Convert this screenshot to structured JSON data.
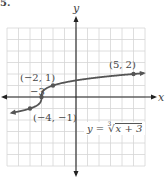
{
  "problem_number": "5.",
  "axes": {
    "x_label": "x",
    "y_label": "y"
  },
  "equation": {
    "lhs": "y =",
    "radical_index": "3",
    "radical_symbol": "√",
    "radicand": "x + 3",
    "full_text": "y = ∛(x + 3)"
  },
  "points": [
    {
      "label": "(5, 2)",
      "x": 5,
      "y": 2
    },
    {
      "label": "(−2, 1)",
      "x": -2,
      "y": 1
    },
    {
      "label": "−3",
      "x": -3,
      "y": 0
    },
    {
      "label": "(−4, −1)",
      "x": -4,
      "y": -1
    }
  ],
  "grid": {
    "xmin": -6,
    "xmax": 6,
    "ymin": -6,
    "ymax": 6,
    "step": 1
  },
  "colors": {
    "curve": "#555555",
    "grid": "#d6d6d6",
    "axis": "#222222",
    "text": "#444444"
  },
  "chart_data": {
    "type": "line",
    "title": "",
    "xlabel": "x",
    "ylabel": "y",
    "function": "y = cbrt(x + 3)",
    "x": [
      -6.5,
      -4,
      -3,
      -2,
      5,
      6
    ],
    "series": [
      {
        "name": "y = ∛(x + 3)",
        "values": [
          -1.52,
          -1,
          0,
          1,
          2,
          2.08
        ]
      }
    ],
    "labeled_points": [
      [
        5,
        2
      ],
      [
        -2,
        1
      ],
      [
        -3,
        0
      ],
      [
        -4,
        -1
      ]
    ],
    "xlim": [
      -6,
      6
    ],
    "ylim": [
      -6,
      6
    ],
    "grid": true
  }
}
